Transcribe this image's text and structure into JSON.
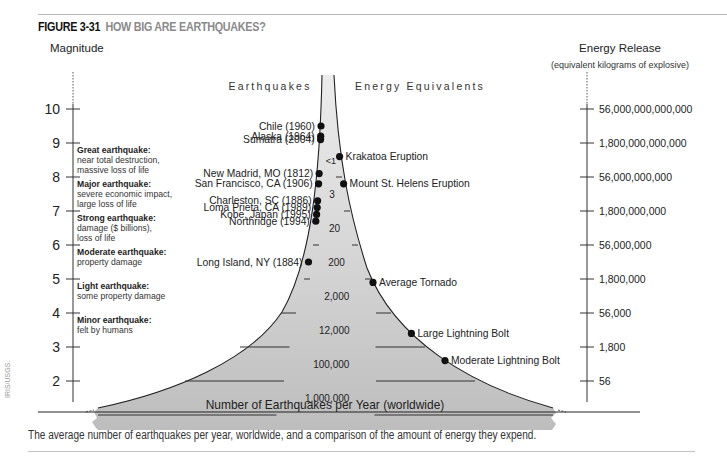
{
  "figure": {
    "number": "FIGURE 3-31",
    "title": "HOW BIG ARE EARTHQUAKES?",
    "caption": "The average number of earthquakes per year, worldwide, and a comparison of the amount of energy they expend.",
    "credit": "IRIS/USGS."
  },
  "colors": {
    "funnel_fill": "#c8c8c8",
    "funnel_fill_light": "#e4e4e4",
    "line": "#222222",
    "dot": "#111111",
    "title_gray": "#8a8a8a"
  },
  "axes": {
    "left_title": "Magnitude",
    "right_title": "Energy Release",
    "right_subtitle": "(equivalent kilograms of explosive)",
    "magnitudes": [
      "10",
      "9",
      "8",
      "7",
      "6",
      "5",
      "4",
      "3",
      "2"
    ],
    "energy": [
      "56,000,000,000,000",
      "1,800,000,000,000",
      "56,000,000,000",
      "1,800,000,000",
      "56,000,000",
      "1,800,000",
      "56,000",
      "1,800",
      "56"
    ]
  },
  "column_headers": {
    "earthquakes": "Earthquakes",
    "energy_equivalents": "Energy Equivalents"
  },
  "categories": [
    {
      "name": "Great earthquake:",
      "desc": [
        "near total destruction,",
        "massive loss of life"
      ]
    },
    {
      "name": "Major earthquake:",
      "desc": [
        "severe economic impact,",
        "large loss of life"
      ]
    },
    {
      "name": "Strong earthquake:",
      "desc": [
        "damage ($ billions),",
        "loss of life"
      ]
    },
    {
      "name": "Moderate earthquake:",
      "desc": [
        "property damage"
      ]
    },
    {
      "name": "Light earthquake:",
      "desc": [
        "some property damage"
      ]
    },
    {
      "name": "Minor earthquake:",
      "desc": [
        "felt by humans"
      ]
    }
  ],
  "earthquakes": [
    {
      "label": "Chile (1960)",
      "magnitude": 9.5
    },
    {
      "label": "Alaska (1964)",
      "magnitude": 9.2
    },
    {
      "label": "Sumatra (2004)",
      "magnitude": 9.1
    },
    {
      "label": "New Madrid, MO (1812)",
      "magnitude": 8.1
    },
    {
      "label": "San Francisco, CA (1906)",
      "magnitude": 7.8
    },
    {
      "label": "Charleston, SC (1886)",
      "magnitude": 7.3
    },
    {
      "label": "Loma Prieta, CA (1989)",
      "magnitude": 7.1
    },
    {
      "label": "Kobe, Japan (1995)",
      "magnitude": 6.9
    },
    {
      "label": "Northridge (1994)",
      "magnitude": 6.7
    },
    {
      "label": "Long Island, NY (1884)",
      "magnitude": 5.5
    }
  ],
  "energy_equivalents": [
    {
      "label": "Krakatoa Eruption",
      "magnitude": 8.6
    },
    {
      "label": "Mount St. Helens Eruption",
      "magnitude": 7.8
    },
    {
      "label": "Average Tornado",
      "magnitude": 4.9
    },
    {
      "label": "Large Lightning Bolt",
      "magnitude": 3.4
    },
    {
      "label": "Moderate Lightning Bolt",
      "magnitude": 2.6
    }
  ],
  "frequency_bands": [
    {
      "label": "<1",
      "magnitude": 8.5
    },
    {
      "label": "3",
      "magnitude": 7.5
    },
    {
      "label": "20",
      "magnitude": 6.5
    },
    {
      "label": "200",
      "magnitude": 5.5
    },
    {
      "label": "2,000",
      "magnitude": 4.5
    },
    {
      "label": "12,000",
      "magnitude": 3.5
    },
    {
      "label": "100,000",
      "magnitude": 2.5
    },
    {
      "label": "1,000,000",
      "magnitude": 1.5
    }
  ],
  "base_label": "Number of Earthquakes per Year (worldwide)"
}
